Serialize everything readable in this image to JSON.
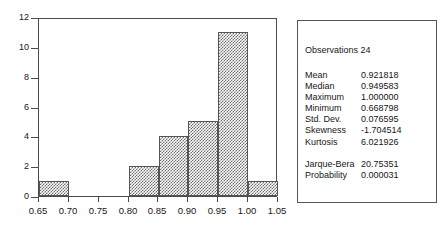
{
  "chart_data": {
    "type": "bar",
    "title": "",
    "subtitle": "",
    "xlabel": "",
    "ylabel": "",
    "xlim": [
      0.65,
      1.05
    ],
    "ylim": [
      0,
      12
    ],
    "grid": false,
    "legend": "none",
    "bin_width": 0.05,
    "bin_edges": [
      0.65,
      0.7,
      0.75,
      0.8,
      0.85,
      0.9,
      0.95,
      1.0,
      1.05
    ],
    "categories": [
      "0.65-0.70",
      "0.70-0.75",
      "0.75-0.80",
      "0.80-0.85",
      "0.85-0.90",
      "0.90-0.95",
      "0.95-1.00",
      "1.00-1.05"
    ],
    "values": [
      1,
      0,
      0,
      2,
      4,
      5,
      11,
      1
    ],
    "x_ticks": [
      "0.65",
      "0.70",
      "0.75",
      "0.80",
      "0.85",
      "0.90",
      "0.95",
      "1.00",
      "1.05"
    ],
    "y_ticks": [
      "0",
      "2",
      "4",
      "6",
      "8",
      "10",
      "12"
    ]
  },
  "stats_panel": {
    "observations_label": "Observations",
    "observations_value": "24",
    "observations_line": "Observations 24",
    "rows": [
      {
        "label": "Mean",
        "value": "0.921818"
      },
      {
        "label": "Median",
        "value": "0.949583"
      },
      {
        "label": "Maximum",
        "value": "1.000000"
      },
      {
        "label": "Minimum",
        "value": "0.668798"
      },
      {
        "label": "Std. Dev.",
        "value": "0.076595"
      },
      {
        "label": "Skewness",
        "value": "-1.704514"
      },
      {
        "label": "Kurtosis",
        "value": "6.021926"
      }
    ],
    "rows_secondary": [
      {
        "label": "Jarque-Bera",
        "value": "20.75351"
      },
      {
        "label": "Probability",
        "value": "0.000031"
      }
    ]
  },
  "colors": {
    "axis": "#4a4a4a",
    "bar_fill": "#6e6e6e",
    "bar_edge": "#555555",
    "text": "#161616",
    "background": "#ffffff",
    "panel_border": "#555555"
  }
}
